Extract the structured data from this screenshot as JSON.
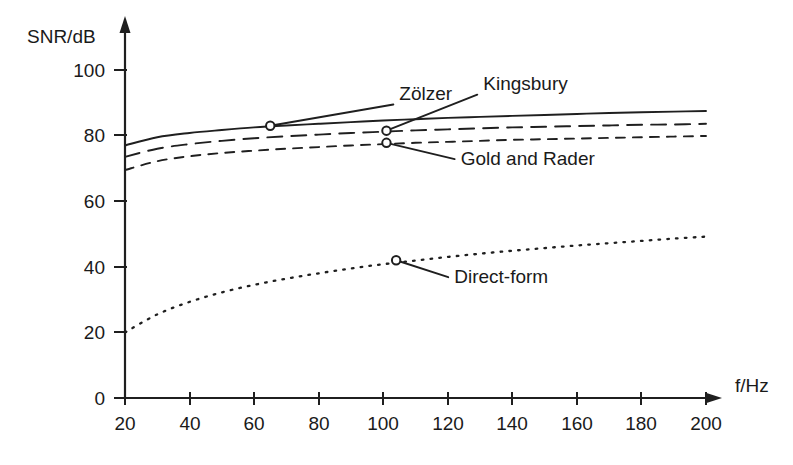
{
  "chart_data": {
    "type": "line",
    "title": "",
    "xlabel": "f/Hz",
    "ylabel": "SNR/dB",
    "xlim": [
      20,
      200
    ],
    "ylim": [
      0,
      108
    ],
    "grid": false,
    "legend_position": "inline-annotations",
    "xticks": [
      20,
      40,
      60,
      80,
      100,
      120,
      140,
      160,
      180,
      200
    ],
    "xtick_labels": [
      "20",
      "40",
      "60",
      "80",
      "100",
      "120",
      "140",
      "160",
      "180",
      "200"
    ],
    "yticks": [
      0,
      20,
      40,
      60,
      80,
      100
    ],
    "ytick_labels": [
      "0",
      "20",
      "40",
      "60",
      "80",
      "100"
    ],
    "x": [
      20,
      30,
      40,
      50,
      60,
      70,
      80,
      90,
      100,
      110,
      120,
      130,
      140,
      150,
      160,
      170,
      180,
      190,
      200
    ],
    "series": [
      {
        "name": "Zölzer",
        "style": "solid",
        "label": "Zölzer",
        "label_x": 105,
        "label_y": 91,
        "marker_x": 65,
        "marker_y": 83,
        "values": [
          77.0,
          79.5,
          80.8,
          81.7,
          82.5,
          83.1,
          83.6,
          84.1,
          84.6,
          85.0,
          85.4,
          85.7,
          86.0,
          86.3,
          86.6,
          86.9,
          87.1,
          87.3,
          87.5
        ]
      },
      {
        "name": "Kingsbury",
        "style": "long-dash",
        "label": "Kingsbury",
        "label_x": 131,
        "label_y": 94,
        "marker_x": 101,
        "marker_y": 81.5,
        "values": [
          73.5,
          76.0,
          77.4,
          78.4,
          79.2,
          79.8,
          80.3,
          80.8,
          81.2,
          81.6,
          81.9,
          82.2,
          82.5,
          82.7,
          82.9,
          83.1,
          83.3,
          83.4,
          83.6
        ]
      },
      {
        "name": "Gold and Rader",
        "style": "short-dash",
        "label": "Gold and Rader",
        "label_x": 124,
        "label_y": 71,
        "marker_x": 101,
        "marker_y": 77.8,
        "values": [
          69.5,
          72.2,
          73.7,
          74.7,
          75.4,
          76.0,
          76.5,
          77.0,
          77.4,
          77.8,
          78.1,
          78.4,
          78.7,
          78.9,
          79.1,
          79.3,
          79.5,
          79.7,
          79.9
        ]
      },
      {
        "name": "Direct-form",
        "style": "dotted",
        "label": "Direct-form",
        "label_x": 122,
        "label_y": 35,
        "marker_x": 104,
        "marker_y": 42,
        "values": [
          20.0,
          25.5,
          29.3,
          32.2,
          34.5,
          36.4,
          38.0,
          39.5,
          40.8,
          41.9,
          43.0,
          44.0,
          44.9,
          45.7,
          46.5,
          47.2,
          47.9,
          48.6,
          49.2
        ]
      }
    ]
  },
  "axes": {
    "y_axis_title": "SNR/dB",
    "x_axis_title": "f/Hz"
  },
  "colors": {
    "ink": "#1f1f1f",
    "background": "#ffffff"
  }
}
